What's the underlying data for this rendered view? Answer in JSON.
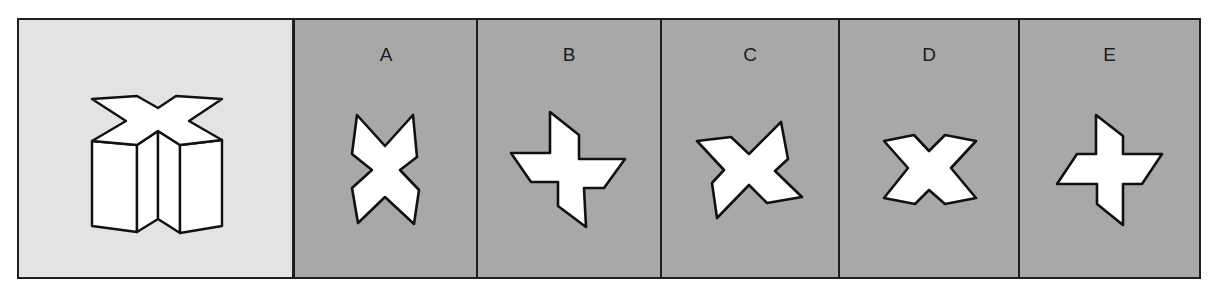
{
  "puzzle": {
    "question_panel": {
      "figure": "x-shaped-prism-3d"
    },
    "options": [
      {
        "label": "A",
        "figure": "x-shape-tall"
      },
      {
        "label": "B",
        "figure": "pinwheel-cross"
      },
      {
        "label": "C",
        "figure": "rotated-x-shape"
      },
      {
        "label": "D",
        "figure": "x-shape-wide"
      },
      {
        "label": "E",
        "figure": "pinwheel-cross-small"
      }
    ]
  },
  "colors": {
    "question_background": "#e3e3e3",
    "option_background": "#a8a8a8",
    "border": "#1e1e1e",
    "shape_fill": "#ffffff",
    "shape_stroke": "#111111"
  }
}
